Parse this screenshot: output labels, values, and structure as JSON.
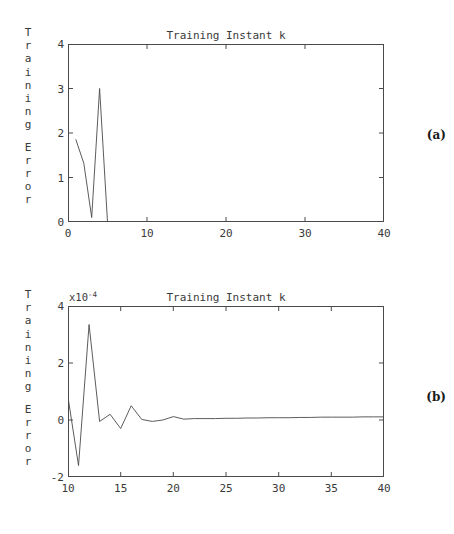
{
  "figures": [
    {
      "panel_label": "(a)",
      "ylabel_text": "Training Error",
      "ylabel_part1": "Training",
      "ylabel_part2": "Error",
      "title": "Training Instant k",
      "exponent_label": "",
      "xticks": [
        "0",
        "10",
        "20",
        "30",
        "40"
      ],
      "yticks": [
        "0",
        "1",
        "2",
        "3",
        "4"
      ]
    },
    {
      "panel_label": "(b)",
      "ylabel_text": "Training Error",
      "ylabel_part1": "Training",
      "ylabel_part2": "Error",
      "title": "Training Instant k",
      "exponent_label": "x10",
      "exponent_sup": "-4",
      "xticks": [
        "10",
        "15",
        "20",
        "25",
        "30",
        "35",
        "40"
      ],
      "yticks": [
        "-2",
        "0",
        "2",
        "4"
      ]
    }
  ],
  "chart_data": [
    {
      "type": "line",
      "title": "Training Instant k",
      "xlabel": "Training Instant k",
      "ylabel": "Training Error",
      "panel": "(a)",
      "xlim": [
        0,
        40
      ],
      "ylim": [
        0,
        4
      ],
      "xticks": [
        0,
        10,
        20,
        30,
        40
      ],
      "yticks": [
        0,
        1,
        2,
        3,
        4
      ],
      "grid": false,
      "legend": "none",
      "series": [
        {
          "name": "Training Error",
          "x": [
            1,
            2,
            3,
            4,
            5,
            6,
            10,
            20,
            30,
            40
          ],
          "values": [
            1.85,
            1.32,
            0.1,
            3.0,
            0.0,
            0.0,
            0.0,
            0.0,
            0.0,
            0.0
          ]
        }
      ]
    },
    {
      "type": "line",
      "title": "Training Instant k",
      "xlabel": "Training Instant k",
      "ylabel": "Training Error",
      "panel": "(b)",
      "y_exponent": "x10^-4",
      "xlim": [
        10,
        40
      ],
      "ylim": [
        -2,
        4
      ],
      "xticks": [
        10,
        15,
        20,
        25,
        30,
        35,
        40
      ],
      "yticks": [
        -2,
        0,
        2,
        4
      ],
      "grid": false,
      "legend": "none",
      "series": [
        {
          "name": "Training Error",
          "x": [
            10,
            11,
            12,
            13,
            14,
            15,
            16,
            17,
            18,
            19,
            20,
            21,
            22,
            23,
            24,
            25,
            26,
            27,
            28,
            29,
            30,
            31,
            32,
            33,
            34,
            35,
            36,
            37,
            38,
            39,
            40
          ],
          "values": [
            0.8,
            -1.6,
            3.35,
            -0.05,
            0.2,
            -0.3,
            0.5,
            0.02,
            -0.05,
            0.0,
            0.12,
            0.03,
            0.05,
            0.05,
            0.05,
            0.06,
            0.06,
            0.07,
            0.07,
            0.08,
            0.08,
            0.08,
            0.09,
            0.09,
            0.1,
            0.1,
            0.1,
            0.1,
            0.11,
            0.11,
            0.11
          ]
        }
      ]
    }
  ]
}
